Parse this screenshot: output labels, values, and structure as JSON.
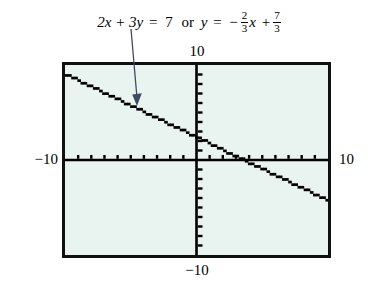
{
  "figure": {
    "kind": "graphing-calculator-screen",
    "caption": {
      "equation_standard_lhs": "2x + 3y",
      "equals": "=",
      "equation_standard_rhs": "7",
      "connector": "or",
      "y_var": "y",
      "equals2": "=",
      "slope_sign": "−",
      "slope_num": "2",
      "slope_den": "3",
      "slope_var": "x",
      "plus": "+",
      "intercept_num": "7",
      "intercept_den": "3",
      "plain_text": "2x + 3y = 7 or y = -2/3 x + 7/3"
    },
    "axis_labels": {
      "top": "10",
      "bottom": "−10",
      "left": "−10",
      "right": "10"
    },
    "colors": {
      "screen_background": "#e9f4f1",
      "screen_border": "#111111",
      "axis": "#000000",
      "plot_line": "#000000",
      "pointer": "#3f4a63",
      "page_background": "#ffffff"
    },
    "annotation": {
      "pointer_label": "pointer-to-line",
      "points_to": "graphed line"
    }
  },
  "chart_data": {
    "type": "line",
    "xlabel": "x",
    "ylabel": "y",
    "xlim": [
      -10,
      10
    ],
    "ylim": [
      -10,
      10
    ],
    "xticks": [
      -9,
      -8,
      -7,
      -6,
      -5,
      -4,
      -3,
      -2,
      -1,
      1,
      2,
      3,
      4,
      5,
      6,
      7,
      8,
      9
    ],
    "yticks": [
      -9,
      -8,
      -7,
      -6,
      -5,
      -4,
      -3,
      -2,
      -1,
      1,
      2,
      3,
      4,
      5,
      6,
      7,
      8,
      9
    ],
    "grid": false,
    "legend": "none",
    "series": [
      {
        "name": "y = -2/3 x + 7/3",
        "slope": -0.6667,
        "intercept": 2.3333,
        "x_intercept": 3.5,
        "style": "pixelated-dotted",
        "x": [
          -10,
          10
        ],
        "y": [
          9.0,
          -4.3333
        ]
      }
    ]
  }
}
